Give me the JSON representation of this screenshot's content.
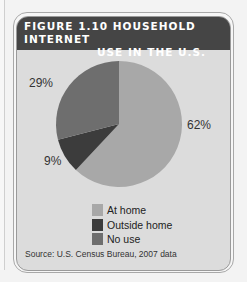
{
  "chart_data": {
    "type": "pie",
    "title": "FIGURE 1.10 HOUSEHOLD INTERNET USE IN THE U.S.",
    "categories": [
      "At home",
      "Outside home",
      "No use"
    ],
    "values": [
      62,
      9,
      29
    ],
    "value_labels": [
      "62%",
      "9%",
      "29%"
    ],
    "colors": [
      "#a8a8a8",
      "#3c3c3c",
      "#6e6e6e"
    ],
    "legend_position": "bottom",
    "source": "Source: U.S. Census Bureau, 2007 data"
  },
  "header": {
    "title_line1": "FIGURE 1.10 HOUSEHOLD INTERNET",
    "title_line2": "USE IN THE U.S."
  },
  "labels": {
    "at_home": "62%",
    "outside_home": "9%",
    "no_use": "29%"
  },
  "legend": {
    "items": [
      {
        "label": "At home",
        "color": "#a8a8a8"
      },
      {
        "label": "Outside home",
        "color": "#3c3c3c"
      },
      {
        "label": "No use",
        "color": "#6e6e6e"
      }
    ]
  },
  "footer": {
    "source": "Source: U.S. Census Bureau, 2007 data"
  }
}
